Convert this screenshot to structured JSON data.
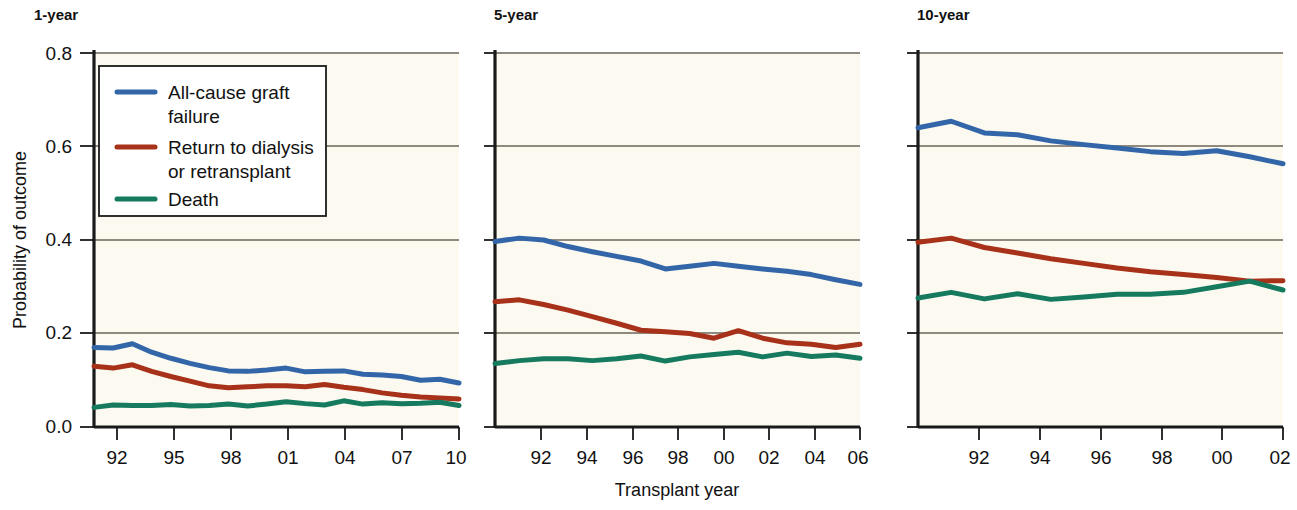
{
  "figure": {
    "background_color": "#ffffff",
    "plot_background_color": "#fbf9f0",
    "axis_color": "#1a1a1a",
    "gridline_color": "#6b6358"
  },
  "axis": {
    "xlabel": "Transplant year",
    "ylabel": "Probability of outcome",
    "yticks": [
      "0.0",
      "0.2",
      "0.4",
      "0.6",
      "0.8"
    ],
    "ylim": [
      0.0,
      0.8
    ]
  },
  "legend": {
    "items": [
      {
        "label_line1": "All-cause graft",
        "label_line2": "failure",
        "color": "#3366a8"
      },
      {
        "label_line1": "Return to dialysis",
        "label_line2": "or retransplant",
        "color": "#a8311a"
      },
      {
        "label_line1": "Death",
        "label_line2": "",
        "color": "#157a5e"
      }
    ]
  },
  "panels": [
    {
      "title": "1-year",
      "xticks": [
        "92",
        "95",
        "98",
        "01",
        "04",
        "07",
        "10"
      ]
    },
    {
      "title": "5-year",
      "xticks": [
        "92",
        "94",
        "96",
        "98",
        "00",
        "02",
        "04",
        "06"
      ]
    },
    {
      "title": "10-year",
      "xticks": [
        "92",
        "94",
        "96",
        "98",
        "00",
        "02"
      ]
    }
  ],
  "chart_data": [
    {
      "type": "line",
      "title": "1-year",
      "xlabel": "Transplant year",
      "ylabel": "Probability of outcome",
      "ylim": [
        0.0,
        0.8
      ],
      "xlim": [
        1991,
        2010
      ],
      "grid": true,
      "legend_position": "upper-left",
      "x": [
        1991,
        1992,
        1993,
        1994,
        1995,
        1996,
        1997,
        1998,
        1999,
        2000,
        2001,
        2002,
        2003,
        2004,
        2005,
        2006,
        2007,
        2008,
        2009,
        2010
      ],
      "series": [
        {
          "name": "All-cause graft failure",
          "color": "#3366a8",
          "values": [
            0.17,
            0.169,
            0.178,
            0.16,
            0.147,
            0.136,
            0.127,
            0.12,
            0.119,
            0.122,
            0.126,
            0.118,
            0.119,
            0.12,
            0.113,
            0.111,
            0.108,
            0.1,
            0.102,
            0.094
          ]
        },
        {
          "name": "Return to dialysis or retransplant",
          "color": "#a8311a",
          "values": [
            0.13,
            0.126,
            0.133,
            0.119,
            0.108,
            0.098,
            0.088,
            0.084,
            0.086,
            0.088,
            0.088,
            0.086,
            0.091,
            0.085,
            0.08,
            0.073,
            0.068,
            0.064,
            0.062,
            0.06
          ]
        },
        {
          "name": "Death",
          "color": "#157a5e",
          "values": [
            0.042,
            0.047,
            0.046,
            0.046,
            0.048,
            0.045,
            0.046,
            0.049,
            0.045,
            0.049,
            0.054,
            0.05,
            0.047,
            0.056,
            0.049,
            0.052,
            0.05,
            0.051,
            0.053,
            0.046
          ]
        }
      ]
    },
    {
      "type": "line",
      "title": "5-year",
      "xlabel": "Transplant year",
      "ylabel": "Probability of outcome",
      "ylim": [
        0.0,
        0.8
      ],
      "xlim": [
        1991,
        2006
      ],
      "grid": true,
      "legend_position": "none",
      "x": [
        1991,
        1992,
        1993,
        1994,
        1995,
        1996,
        1997,
        1998,
        1999,
        2000,
        2001,
        2002,
        2003,
        2004,
        2005,
        2006
      ],
      "series": [
        {
          "name": "All-cause graft failure",
          "color": "#3366a8",
          "values": [
            0.397,
            0.404,
            0.4,
            0.386,
            0.375,
            0.365,
            0.355,
            0.338,
            0.344,
            0.35,
            0.344,
            0.338,
            0.333,
            0.326,
            0.315,
            0.305
          ]
        },
        {
          "name": "Return to dialysis or retransplant",
          "color": "#a8311a",
          "values": [
            0.268,
            0.272,
            0.262,
            0.25,
            0.236,
            0.222,
            0.207,
            0.204,
            0.2,
            0.19,
            0.206,
            0.19,
            0.18,
            0.177,
            0.17,
            0.177
          ]
        },
        {
          "name": "Death",
          "color": "#157a5e",
          "values": [
            0.136,
            0.142,
            0.146,
            0.146,
            0.142,
            0.146,
            0.152,
            0.141,
            0.15,
            0.155,
            0.16,
            0.15,
            0.158,
            0.151,
            0.154,
            0.147
          ]
        }
      ]
    },
    {
      "type": "line",
      "title": "10-year",
      "xlabel": "Transplant year",
      "ylabel": "Probability of outcome",
      "ylim": [
        0.0,
        0.8
      ],
      "xlim": [
        1991,
        2002
      ],
      "grid": true,
      "legend_position": "none",
      "x": [
        1991,
        1992,
        1993,
        1994,
        1995,
        1996,
        1997,
        1998,
        1999,
        2000,
        2001,
        2002
      ],
      "series": [
        {
          "name": "All-cause graft failure",
          "color": "#3366a8",
          "values": [
            0.64,
            0.654,
            0.629,
            0.625,
            0.612,
            0.604,
            0.597,
            0.589,
            0.585,
            0.591,
            0.578,
            0.563
          ]
        },
        {
          "name": "Return to dialysis or retransplant",
          "color": "#a8311a",
          "values": [
            0.395,
            0.404,
            0.384,
            0.372,
            0.36,
            0.35,
            0.34,
            0.332,
            0.326,
            0.32,
            0.312,
            0.313
          ]
        },
        {
          "name": "Death",
          "color": "#157a5e",
          "values": [
            0.276,
            0.288,
            0.274,
            0.285,
            0.273,
            0.278,
            0.284,
            0.284,
            0.288,
            0.3,
            0.312,
            0.293
          ]
        }
      ]
    }
  ]
}
